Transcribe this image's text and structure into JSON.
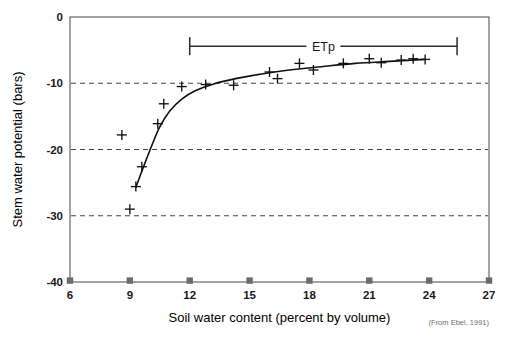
{
  "figure": {
    "credit": "(From Ebel, 1991)",
    "annotation_label": "ETp"
  },
  "chart_data": {
    "type": "scatter",
    "title": "",
    "xlabel": "Soil water content (percent by volume)",
    "ylabel": "Stem water potential (bars)",
    "xlim": [
      6,
      27
    ],
    "ylim": [
      -40,
      0
    ],
    "xticks": [
      6,
      9,
      12,
      15,
      18,
      21,
      24,
      27
    ],
    "xtick_labels": [
      "6",
      "9",
      "12",
      "15",
      "18",
      "21",
      "24",
      "27"
    ],
    "yticks": [
      0,
      -10,
      -20,
      -30,
      -40
    ],
    "ytick_labels": [
      "0",
      "-10",
      "-20",
      "-30",
      "-40"
    ],
    "grid": "horizontal-dashed",
    "gridlines_y": [
      -10,
      -20,
      -30
    ],
    "legend": "none",
    "marker": "plus",
    "series": [
      {
        "name": "Stem water potential observations",
        "marker": "plus",
        "points": [
          {
            "x": 9.0,
            "y": -29.0
          },
          {
            "x": 9.3,
            "y": -25.6
          },
          {
            "x": 9.6,
            "y": -22.6
          },
          {
            "x": 8.6,
            "y": -17.8
          },
          {
            "x": 10.4,
            "y": -16.1
          },
          {
            "x": 10.7,
            "y": -13.1
          },
          {
            "x": 11.6,
            "y": -10.5
          },
          {
            "x": 12.8,
            "y": -10.2
          },
          {
            "x": 14.2,
            "y": -10.3
          },
          {
            "x": 16.0,
            "y": -8.3
          },
          {
            "x": 16.4,
            "y": -9.3
          },
          {
            "x": 17.5,
            "y": -7.0
          },
          {
            "x": 18.2,
            "y": -8.0
          },
          {
            "x": 19.7,
            "y": -7.0
          },
          {
            "x": 21.0,
            "y": -6.3
          },
          {
            "x": 21.6,
            "y": -6.9
          },
          {
            "x": 22.6,
            "y": -6.5
          },
          {
            "x": 23.2,
            "y": -6.3
          },
          {
            "x": 23.8,
            "y": -6.4
          }
        ]
      }
    ],
    "fit_curve": {
      "name": "Fitted response curve",
      "type": "line",
      "points": [
        {
          "x": 9.3,
          "y": -25.7
        },
        {
          "x": 9.7,
          "y": -22.5
        },
        {
          "x": 10.1,
          "y": -19.4
        },
        {
          "x": 10.5,
          "y": -16.6
        },
        {
          "x": 11.0,
          "y": -14.2
        },
        {
          "x": 11.6,
          "y": -12.4
        },
        {
          "x": 12.3,
          "y": -11.1
        },
        {
          "x": 13.2,
          "y": -10.1
        },
        {
          "x": 14.3,
          "y": -9.3
        },
        {
          "x": 15.6,
          "y": -8.6
        },
        {
          "x": 17.0,
          "y": -8.0
        },
        {
          "x": 18.6,
          "y": -7.5
        },
        {
          "x": 20.3,
          "y": -7.0
        },
        {
          "x": 22.0,
          "y": -6.7
        },
        {
          "x": 23.8,
          "y": -6.4
        }
      ]
    },
    "annotations": [
      {
        "label": "ETp",
        "type": "range-bracket",
        "x_start": 12.0,
        "x_end": 25.4,
        "y": -4.4
      }
    ]
  }
}
